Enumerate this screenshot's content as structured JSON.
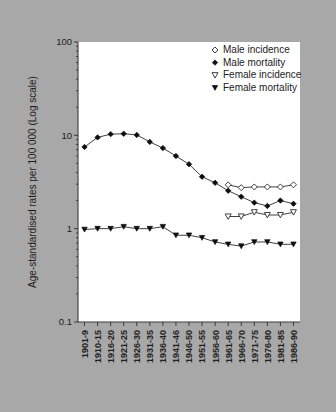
{
  "chart_data": {
    "type": "line",
    "title": "",
    "xlabel": "",
    "ylabel": "Age-standardised rates per 100 000 (Log scale)",
    "scale": "log",
    "ylim": [
      0.1,
      100
    ],
    "ytick_labels": [
      "100",
      "10",
      "1",
      "0.1"
    ],
    "ytick_values": [
      100,
      10,
      1,
      0.1
    ],
    "grid": false,
    "legend_position": "top-right",
    "categories": [
      "1901-9",
      "1910-15",
      "1916-20",
      "1921-25",
      "1926-30",
      "1931-35",
      "1936-40",
      "1941-46",
      "1946-50",
      "1951-55",
      "1956-60",
      "1961-65",
      "1966-70",
      "1971-75",
      "1976-80",
      "1981-85",
      "1986-90"
    ],
    "series": [
      {
        "name": "Male incidence",
        "marker": "open-diamond",
        "start_index": 11,
        "values": [
          null,
          null,
          null,
          null,
          null,
          null,
          null,
          null,
          null,
          null,
          null,
          2.95,
          2.75,
          2.8,
          2.8,
          2.8,
          2.95
        ]
      },
      {
        "name": "Male mortality",
        "marker": "filled-diamond",
        "start_index": 0,
        "values": [
          7.5,
          9.5,
          10.3,
          10.4,
          10.1,
          8.5,
          7.3,
          6.0,
          4.9,
          3.6,
          3.1,
          2.55,
          2.2,
          1.9,
          1.75,
          2.0,
          1.85
        ]
      },
      {
        "name": "Female incidence",
        "marker": "open-triangle-down",
        "start_index": 11,
        "values": [
          null,
          null,
          null,
          null,
          null,
          null,
          null,
          null,
          null,
          null,
          null,
          1.35,
          1.35,
          1.5,
          1.4,
          1.4,
          1.5
        ]
      },
      {
        "name": "Female mortality",
        "marker": "filled-triangle-down",
        "start_index": 0,
        "values": [
          0.98,
          1.0,
          1.0,
          1.05,
          1.0,
          1.0,
          1.05,
          0.85,
          0.85,
          0.8,
          0.72,
          0.68,
          0.65,
          0.72,
          0.72,
          0.68,
          0.68
        ]
      }
    ],
    "legend": [
      {
        "label": "Male incidence",
        "marker": "open-diamond"
      },
      {
        "label": "Male mortality",
        "marker": "filled-diamond"
      },
      {
        "label": "Female incidence",
        "marker": "open-triangle-down"
      },
      {
        "label": "Female mortality",
        "marker": "filled-triangle-down"
      }
    ],
    "colors": {
      "background": "#a8a8a8",
      "plot_background": "#ffffff",
      "line": "#2b2b2b",
      "marker_filled": "#0d0d0d",
      "text": "#1c1c1c"
    }
  }
}
